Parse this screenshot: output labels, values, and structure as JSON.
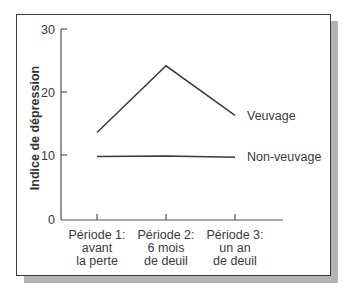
{
  "chart_data": {
    "type": "line",
    "title": "",
    "xlabel": "",
    "ylabel": "Indice de dépression",
    "ylim": [
      0,
      30
    ],
    "yticks": [
      0,
      10,
      20,
      30
    ],
    "grid": false,
    "legend_position": "inline-right",
    "categories": [
      [
        "Période 1:",
        "avant",
        "la perte"
      ],
      [
        "Période 2:",
        "6 mois",
        "de deuil"
      ],
      [
        "Période 3:",
        "un an",
        "de deuil"
      ]
    ],
    "series": [
      {
        "name": "Veuvage",
        "values": [
          13.7,
          24.2,
          16.4
        ],
        "color": "#3a3a3a"
      },
      {
        "name": "Non-veuvage",
        "values": [
          9.9,
          10.0,
          9.8
        ],
        "color": "#3a3a3a"
      }
    ]
  },
  "labels": {
    "ytick_0": "0",
    "ytick_10": "10",
    "ytick_20": "20",
    "ytick_30": "30",
    "ylabel": "Indice de dépression",
    "cat1_l1": "Période 1:",
    "cat1_l2": "avant",
    "cat1_l3": "la perte",
    "cat2_l1": "Période 2:",
    "cat2_l2": "6 mois",
    "cat2_l3": "de deuil",
    "cat3_l1": "Période 3:",
    "cat3_l2": "un an",
    "cat3_l3": "de deuil",
    "series_veuvage": "Veuvage",
    "series_nonveuvage": "Non-veuvage"
  }
}
